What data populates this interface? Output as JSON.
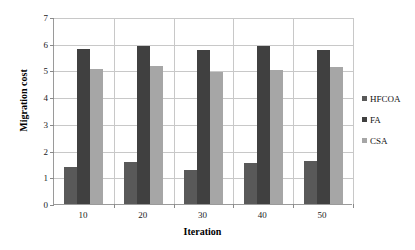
{
  "chart_data": {
    "type": "bar",
    "title": "",
    "xlabel": "Iteration",
    "ylabel": "Migration cost",
    "categories": [
      "10",
      "20",
      "30",
      "40",
      "50"
    ],
    "series": [
      {
        "name": "HFCOA",
        "color": "#595959",
        "values": [
          1.4,
          1.57,
          1.27,
          1.55,
          1.62
        ]
      },
      {
        "name": "FA",
        "color": "#404040",
        "values": [
          5.8,
          5.9,
          5.78,
          5.9,
          5.78
        ]
      },
      {
        "name": "CSA",
        "color": "#a6a6a6",
        "values": [
          5.07,
          5.15,
          4.95,
          5.02,
          5.12
        ]
      }
    ],
    "ylim": [
      0,
      7
    ],
    "yticks": [
      "0",
      "1",
      "2",
      "3",
      "4",
      "5",
      "6",
      "7"
    ],
    "grid": true,
    "legend_position": "right"
  },
  "legend": {
    "entries": [
      {
        "label": "HFCOA",
        "color": "#595959"
      },
      {
        "label": "FA",
        "color": "#404040"
      },
      {
        "label": "CSA",
        "color": "#a6a6a6"
      }
    ]
  }
}
